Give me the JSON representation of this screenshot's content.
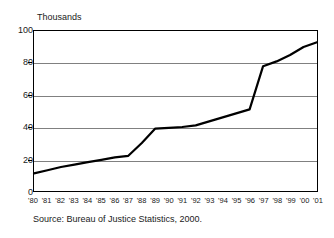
{
  "chart_data": {
    "type": "line",
    "title": "",
    "subtitle": "",
    "unit_label": "Thousands",
    "xlabel": "",
    "ylabel": "",
    "ylim": [
      0,
      100
    ],
    "yticks": [
      0,
      20,
      40,
      60,
      80,
      100
    ],
    "ytick_labels": [
      "0",
      "20",
      "40",
      "60",
      "80",
      "100"
    ],
    "grid": true,
    "grid_values": [
      20,
      40,
      60,
      80
    ],
    "legend": "none",
    "categories": [
      "'80",
      "'81",
      "'82",
      "'83",
      "'84",
      "'85",
      "'86",
      "'87",
      "'88",
      "'89",
      "'90",
      "'91",
      "'92",
      "'93",
      "'94",
      "'95",
      "'96",
      "'97",
      "'98",
      "'99",
      "'00",
      "'01"
    ],
    "series": [
      {
        "name": "Count",
        "values": [
          11,
          13,
          15,
          16.5,
          18,
          19.5,
          21,
          22,
          30,
          39,
          39.5,
          40,
          41,
          43.5,
          46,
          48.5,
          51,
          78,
          81,
          85,
          90,
          93
        ]
      }
    ],
    "line_color": "#000000",
    "grid_color": "#808080",
    "axis_color": "#000000",
    "source": "Source: Bureau of Justice Statistics, 2000."
  }
}
